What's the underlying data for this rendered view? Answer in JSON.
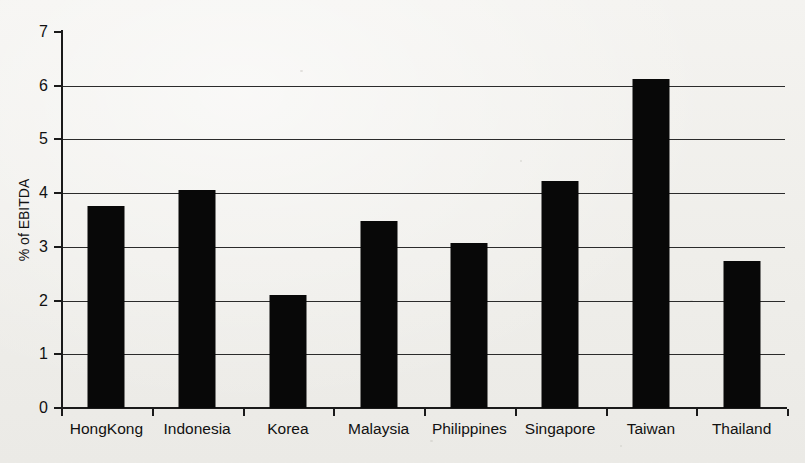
{
  "chart_data": {
    "type": "bar",
    "title": "",
    "xlabel": "",
    "ylabel": "% of EBITDA",
    "categories": [
      "HongKong",
      "Indonesia",
      "Korea",
      "Malaysia",
      "Philippines",
      "Singapore",
      "Taiwan",
      "Thailand"
    ],
    "values": [
      3.76,
      4.05,
      2.1,
      3.48,
      3.08,
      4.22,
      6.12,
      2.74
    ],
    "ylim": [
      0,
      7
    ],
    "ytick_labels": [
      "0",
      "1",
      "2",
      "3",
      "4",
      "5",
      "6",
      "7"
    ],
    "ytick_values": [
      0,
      1,
      2,
      3,
      4,
      5,
      6,
      7
    ],
    "gridline_values": [
      1,
      2,
      3,
      4,
      5,
      6
    ],
    "grid": true,
    "legend": "none",
    "bar_color": "#080808",
    "background_color": "#f2f1ee",
    "axis_color": "#1a1a1a"
  }
}
